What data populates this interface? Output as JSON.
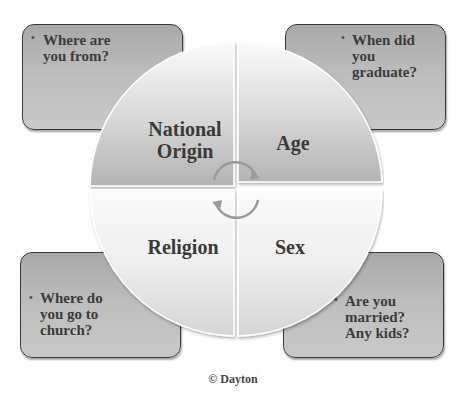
{
  "diagram": {
    "type": "quadrant-cycle-wheel",
    "center_arrows": "circular-cycle-arrows",
    "colors": {
      "box_fill": "#bdbdbd",
      "box_border": "#3a3a3a",
      "quadrant_fill_light": "#f4f4f4",
      "quadrant_fill_dark": "#b8b8b8",
      "text": "#3a3a3a"
    },
    "quadrants": [
      {
        "position": "top-left",
        "label_line1": "National",
        "label_line2": "Origin"
      },
      {
        "position": "top-right",
        "label": "Age"
      },
      {
        "position": "bottom-left",
        "label": "Religion"
      },
      {
        "position": "bottom-right",
        "label": "Sex"
      }
    ],
    "callouts": [
      {
        "position": "top-left",
        "bullet": "•",
        "text_lines": [
          "Where are",
          "you from?"
        ]
      },
      {
        "position": "top-right",
        "bullet": "•",
        "text_lines": [
          "When did",
          "you",
          "graduate?"
        ]
      },
      {
        "position": "bottom-left",
        "bullet": "•",
        "text_lines": [
          "Where do",
          "you go to",
          "church?"
        ]
      },
      {
        "position": "bottom-right",
        "bullet": "•",
        "text_lines": [
          "Are you",
          "married?",
          "Any kids?"
        ]
      }
    ]
  },
  "footer": {
    "copyright": "© Dayton"
  }
}
